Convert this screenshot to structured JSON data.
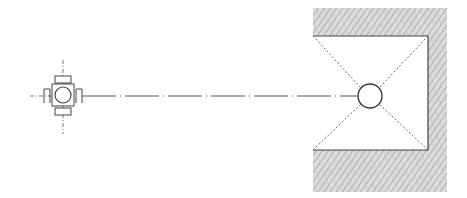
{
  "diagram": {
    "type": "technical-plan-drawing",
    "colors": {
      "background": "#ffffff",
      "line": "#555555",
      "hatch": "#9a9a9a",
      "hatch_fill": "#d9d9d9"
    },
    "elements": {
      "fixture": {
        "label": "",
        "center": [
          63,
          96
        ]
      },
      "centerline": {
        "from": [
          80,
          96
        ],
        "to": [
          358,
          96
        ],
        "style": "dash-dot"
      },
      "target_circle": {
        "center": [
          370,
          96
        ],
        "radius": 12
      },
      "wall": {
        "outer": [
          313,
          8,
          447,
          192
        ],
        "opening": [
          313,
          36,
          428,
          150
        ]
      }
    }
  }
}
